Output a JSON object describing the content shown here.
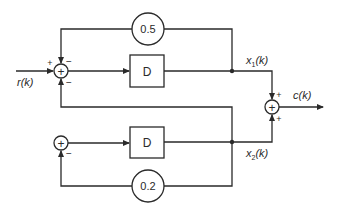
{
  "diagram": {
    "type": "block-diagram",
    "input": {
      "label": "r(k)",
      "sign": "+"
    },
    "output": {
      "label": "c(k)"
    },
    "blocks": [
      {
        "id": "delay1",
        "label": "D"
      },
      {
        "id": "delay2",
        "label": "D"
      }
    ],
    "gains": [
      {
        "id": "gain1",
        "label": "0.5"
      },
      {
        "id": "gain2",
        "label": "0.2"
      }
    ],
    "signals": {
      "x1": {
        "base": "x",
        "sub": "1",
        "arg": "(k)"
      },
      "x2": {
        "base": "x",
        "sub": "2",
        "arg": "(k)"
      }
    },
    "summers": [
      {
        "id": "sum1",
        "symbol": "+",
        "signs": {
          "input": "+",
          "top": "−",
          "bottom": "−"
        }
      },
      {
        "id": "sum2",
        "symbol": "+",
        "signs": {
          "bottom": "−"
        }
      },
      {
        "id": "sum3",
        "symbol": "+",
        "signs": {
          "top": "+",
          "bottom": "+"
        }
      }
    ],
    "colors": {
      "line": "#2a2a2a",
      "background": "#ffffff"
    }
  }
}
